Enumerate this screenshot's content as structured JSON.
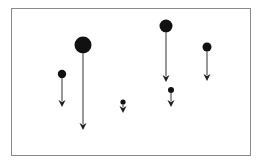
{
  "diagram": {
    "frame": {
      "x": 11,
      "y": 8,
      "width": 239,
      "height": 147,
      "stroke": "#8a8a8a",
      "fill": "#ffffff"
    },
    "colors": {
      "circle": "#111111",
      "arrow_line": "#555555",
      "arrow_head": "#222222"
    },
    "objects": [
      {
        "id": 1,
        "cx": 62,
        "cy": 74,
        "r": 4.2,
        "arrow_end_y": 107
      },
      {
        "id": 2,
        "cx": 83,
        "cy": 45,
        "r": 8.5,
        "arrow_end_y": 130
      },
      {
        "id": 3,
        "cx": 123,
        "cy": 102,
        "r": 2.6,
        "arrow_end_y": 113
      },
      {
        "id": 4,
        "cx": 166,
        "cy": 26,
        "r": 6.5,
        "arrow_end_y": 82
      },
      {
        "id": 5,
        "cx": 171,
        "cy": 90,
        "r": 3.0,
        "arrow_end_y": 107
      },
      {
        "id": 6,
        "cx": 207,
        "cy": 47,
        "r": 4.5,
        "arrow_end_y": 81
      }
    ]
  }
}
